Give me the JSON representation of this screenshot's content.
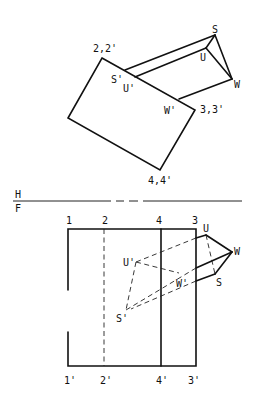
{
  "diagram": {
    "fold_line": {
      "upper_label": "H",
      "lower_label": "F"
    },
    "top_view": {
      "plane_corner_labels": [
        "2,2'",
        "3,3'",
        "4,4'"
      ],
      "prism_labels": [
        "S",
        "U",
        "W"
      ],
      "pierce_labels": [
        "S'",
        "U'",
        "W'"
      ]
    },
    "front_view": {
      "edge_labels_top": [
        "1",
        "2",
        "4",
        "3"
      ],
      "edge_labels_bottom": [
        "1'",
        "2'",
        "4'",
        "3'"
      ],
      "prism_labels": [
        "U",
        "W",
        "S"
      ],
      "pierce_labels": [
        "U'",
        "W'",
        "S'"
      ]
    }
  }
}
